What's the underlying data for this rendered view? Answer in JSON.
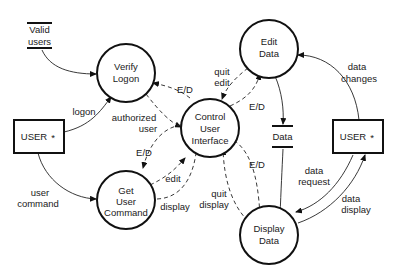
{
  "diagram": {
    "type": "data-flow-diagram",
    "colors": {
      "stroke": "#111111",
      "background": "#ffffff",
      "text": "#1a1a1a"
    },
    "processes": [
      {
        "id": "verify_logon",
        "lines": [
          "Verify",
          "Logon"
        ]
      },
      {
        "id": "edit_data",
        "lines": [
          "Edit",
          "Data"
        ]
      },
      {
        "id": "control_ui",
        "lines": [
          "Control",
          "User",
          "Interface"
        ]
      },
      {
        "id": "get_user_command",
        "lines": [
          "Get",
          "User",
          "Command"
        ]
      },
      {
        "id": "display_data",
        "lines": [
          "Display",
          "Data"
        ]
      }
    ],
    "stores": [
      {
        "id": "valid_users",
        "lines": [
          "Valid",
          "users"
        ]
      },
      {
        "id": "data",
        "lines": [
          "Data"
        ]
      }
    ],
    "terminators": [
      {
        "id": "user_left",
        "label": "USER",
        "marker": "*"
      },
      {
        "id": "user_right",
        "label": "USER",
        "marker": "*"
      }
    ],
    "flows": {
      "logon": [
        "logon"
      ],
      "user_command": [
        "user",
        "command"
      ],
      "authorized_user": [
        "authorized",
        "user"
      ],
      "ed_verify": [
        "E/D"
      ],
      "quit_edit": [
        "quit",
        "edit"
      ],
      "ed_edit": [
        "E/D"
      ],
      "ed_get": [
        "E/D"
      ],
      "edit": [
        "edit"
      ],
      "display": [
        "display"
      ],
      "quit_display": [
        "quit",
        "display"
      ],
      "ed_display": [
        "E/D"
      ],
      "data_changes": [
        "data",
        "changes"
      ],
      "data_request": [
        "data",
        "request"
      ],
      "data_display": [
        "data",
        "display"
      ]
    }
  }
}
